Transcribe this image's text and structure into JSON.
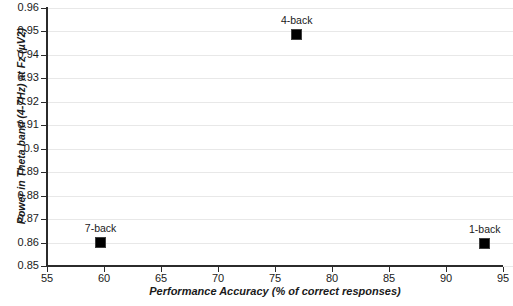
{
  "chart_data": {
    "type": "scatter",
    "title": "",
    "xlabel": "Performance Accuracy (% of correct responses)",
    "ylabel": "Power in Theta band (4-7Hz) at Fz (µV2)",
    "xlim": [
      55,
      95
    ],
    "ylim": [
      0.85,
      0.96
    ],
    "xticks": [
      55,
      60,
      65,
      70,
      75,
      80,
      85,
      90,
      95
    ],
    "xtick_labels": [
      "55",
      "60",
      "65",
      "70",
      "75",
      "80",
      "85",
      "90",
      "95"
    ],
    "yticks": [
      0.85,
      0.86,
      0.87,
      0.88,
      0.89,
      0.9,
      0.91,
      0.92,
      0.93,
      0.94,
      0.95,
      0.96
    ],
    "ytick_labels": [
      "0.85",
      "0.86",
      "0.87",
      "0.88",
      "0.89",
      "0.9",
      "0.91",
      "0.92",
      "0.93",
      "0.94",
      "0.95",
      "0.96"
    ],
    "grid": "horizontal",
    "legend": "none",
    "marker": "filled-square",
    "marker_color": "#000000",
    "points": [
      {
        "label": "7-back",
        "x": 59.7,
        "y": 0.86
      },
      {
        "label": "4-back",
        "x": 76.9,
        "y": 0.9485
      },
      {
        "label": "1-back",
        "x": 93.4,
        "y": 0.8595
      }
    ]
  }
}
